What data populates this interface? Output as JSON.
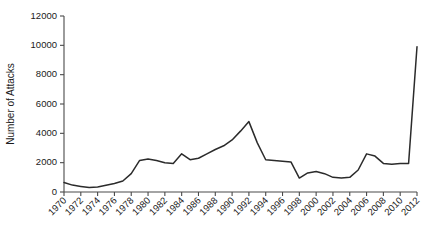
{
  "chart_data": {
    "type": "line",
    "title": "",
    "xlabel": "",
    "ylabel": "Number of Attacks",
    "xlim": [
      1970,
      2012
    ],
    "ylim": [
      0,
      12000
    ],
    "grid": false,
    "legend": false,
    "y_ticks": [
      0,
      2000,
      4000,
      6000,
      8000,
      10000,
      12000
    ],
    "y_tick_labels": [
      "0",
      "2000",
      "4000",
      "6000",
      "8000",
      "10000",
      "12000"
    ],
    "x_tick_labels": [
      "1970",
      "1972",
      "1974",
      "1976",
      "1978",
      "1980",
      "1982",
      "1984",
      "1986",
      "1988",
      "1990",
      "1992",
      "1994",
      "1996",
      "1998",
      "2000",
      "2002",
      "2004",
      "2006",
      "2008",
      "2010",
      "2012"
    ],
    "x_tick_label_rotation": 45,
    "x": [
      1970,
      1971,
      1972,
      1973,
      1974,
      1975,
      1976,
      1977,
      1978,
      1979,
      1980,
      1981,
      1982,
      1983,
      1984,
      1985,
      1986,
      1987,
      1988,
      1989,
      1990,
      1991,
      1992,
      1993,
      1994,
      1995,
      1996,
      1997,
      1998,
      1999,
      2000,
      2001,
      2002,
      2003,
      2004,
      2005,
      2006,
      2007,
      2008,
      2009,
      2010,
      2011,
      2012
    ],
    "values": [
      650,
      470,
      380,
      300,
      340,
      460,
      580,
      750,
      1250,
      2150,
      2250,
      2150,
      2000,
      1950,
      2600,
      2200,
      2300,
      2600,
      2900,
      3150,
      3550,
      4150,
      4800,
      3350,
      2200,
      2150,
      2100,
      2050,
      950,
      1300,
      1400,
      1250,
      1000,
      950,
      1000,
      1500,
      2600,
      2450,
      1950,
      1900,
      1950,
      1950,
      9900
    ],
    "series_color": "#2b2b2b"
  },
  "axis": {
    "y_title": "Number of Attacks"
  }
}
